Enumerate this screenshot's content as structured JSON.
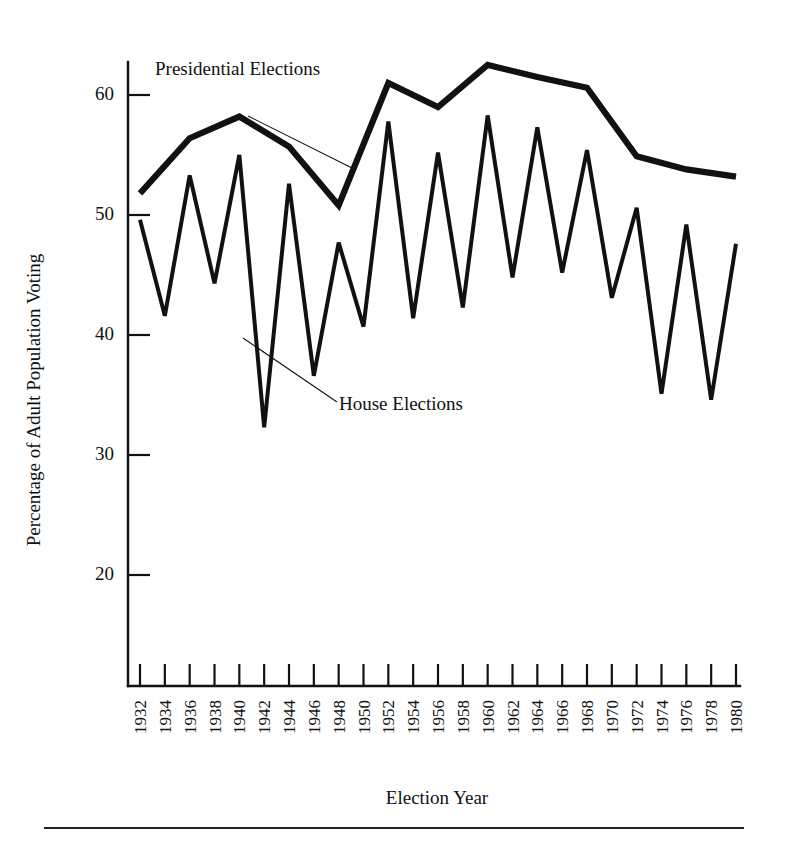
{
  "figure": {
    "background_color": "#ffffff",
    "line_color": "#111111",
    "footer_rule": "horizontal-rule"
  },
  "axes": {
    "y_axis_title": "Percentage of Adult Population Voting",
    "x_axis_title": "Election Year",
    "y_ticks": [
      20,
      30,
      40,
      50,
      60
    ],
    "y_tick_labels": [
      "20",
      "30",
      "40",
      "50",
      "60"
    ],
    "y_limits": [
      12,
      66
    ],
    "x_tick_labels": [
      "1932",
      "1934",
      "1936",
      "1938",
      "1940",
      "1942",
      "1944",
      "1946",
      "1948",
      "1950",
      "1952",
      "1954",
      "1956",
      "1958",
      "1960",
      "1962",
      "1964",
      "1966",
      "1968",
      "1970",
      "1972",
      "1974",
      "1976",
      "1978",
      "1980"
    ]
  },
  "annotations": [
    {
      "name": "presidential-elections-label",
      "text": "Presidential Elections"
    },
    {
      "name": "house-elections-label",
      "text": "House Elections"
    }
  ],
  "chart_data": {
    "type": "line",
    "title": "",
    "xlabel": "Election Year",
    "ylabel": "Percentage of Adult Population Voting",
    "ylim": [
      12,
      66
    ],
    "grid": false,
    "legend_position": "inline-annotations",
    "x": [
      1932,
      1934,
      1936,
      1938,
      1940,
      1942,
      1944,
      1946,
      1948,
      1950,
      1952,
      1954,
      1956,
      1958,
      1960,
      1962,
      1964,
      1966,
      1968,
      1970,
      1972,
      1974,
      1976,
      1978,
      1980
    ],
    "categories": [
      "1932",
      "1934",
      "1936",
      "1938",
      "1940",
      "1942",
      "1944",
      "1946",
      "1948",
      "1950",
      "1952",
      "1954",
      "1956",
      "1958",
      "1960",
      "1962",
      "1964",
      "1966",
      "1968",
      "1970",
      "1972",
      "1974",
      "1976",
      "1978",
      "1980"
    ],
    "series": [
      {
        "name": "Presidential Elections",
        "x": [
          1932,
          1936,
          1940,
          1944,
          1948,
          1952,
          1956,
          1960,
          1964,
          1968,
          1972,
          1976,
          1980
        ],
        "values": [
          51.8,
          56.4,
          58.2,
          55.7,
          50.8,
          61.0,
          59.0,
          62.5,
          61.5,
          60.6,
          54.9,
          53.8,
          53.2
        ]
      },
      {
        "name": "House Elections",
        "x": [
          1932,
          1934,
          1936,
          1938,
          1940,
          1942,
          1944,
          1946,
          1948,
          1950,
          1952,
          1954,
          1956,
          1958,
          1960,
          1962,
          1964,
          1966,
          1968,
          1970,
          1972,
          1974,
          1976,
          1978,
          1980
        ],
        "values": [
          49.6,
          41.6,
          53.3,
          44.3,
          55.0,
          32.3,
          52.6,
          36.6,
          47.7,
          40.7,
          57.8,
          41.4,
          55.2,
          42.3,
          58.3,
          44.8,
          57.3,
          45.2,
          55.4,
          43.1,
          50.6,
          35.1,
          49.2,
          34.6,
          47.6
        ]
      }
    ]
  }
}
